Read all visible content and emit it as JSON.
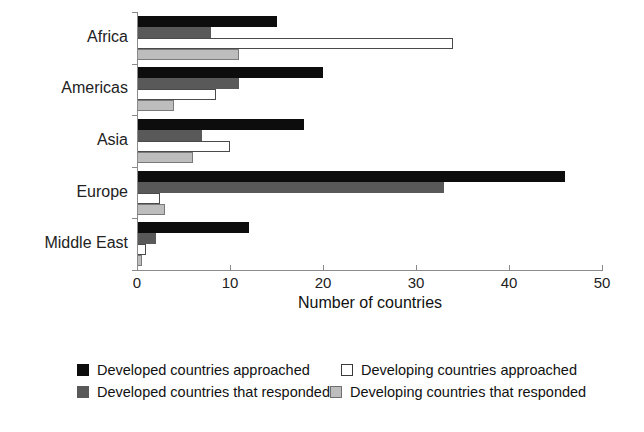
{
  "chart_data": {
    "type": "bar",
    "orientation": "horizontal",
    "title": "",
    "xlabel": "Number of countries",
    "ylabel": "",
    "xlim": [
      0,
      50
    ],
    "xticks": [
      0,
      10,
      20,
      30,
      40,
      50
    ],
    "xtick_labels": [
      "0",
      "10",
      "20",
      "30",
      "40",
      "50"
    ],
    "grid": false,
    "legend_position": "bottom",
    "categories": [
      "Africa",
      "Americas",
      "Asia",
      "Europe",
      "Middle East"
    ],
    "series": [
      {
        "name": "Developed countries approached",
        "color": "#0d0d0d",
        "style": "black",
        "values": [
          15,
          20,
          18,
          46,
          12
        ]
      },
      {
        "name": "Developed countries that responded",
        "color": "#595959",
        "style": "darkgray",
        "values": [
          8,
          11,
          7,
          33,
          2
        ]
      },
      {
        "name": "Developing countries approached",
        "color": "#ffffff",
        "style": "white",
        "values": [
          34,
          8.5,
          10,
          2.5,
          1
        ]
      },
      {
        "name": "Developing countries that responded",
        "color": "#bdbdbd",
        "style": "lightgray",
        "values": [
          11,
          4,
          6,
          3,
          0.5
        ]
      }
    ]
  },
  "axis": {
    "x_title": "Number of countries"
  },
  "legend": {
    "entries": [
      {
        "label": "Developed countries approached",
        "style": "black"
      },
      {
        "label": "Developing countries approached",
        "style": "white"
      },
      {
        "label": "Developed countries that responded",
        "style": "darkgray"
      },
      {
        "label": "Developing countries that responded",
        "style": "lightgray"
      }
    ]
  }
}
